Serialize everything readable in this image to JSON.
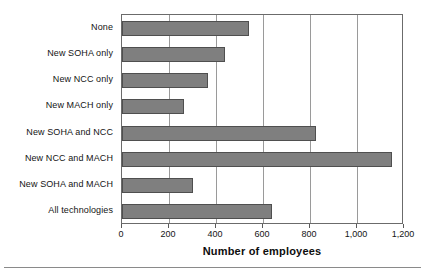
{
  "chart_data": {
    "type": "bar",
    "orientation": "horizontal",
    "title": "",
    "xlabel": "Number of employees",
    "ylabel": "",
    "categories": [
      "None",
      "New SOHA only",
      "New NCC only",
      "New MACH only",
      "New SOHA and NCC",
      "New NCC and MACH",
      "New SOHA and MACH",
      "All technologies"
    ],
    "values": [
      540,
      440,
      365,
      265,
      825,
      1150,
      300,
      640
    ],
    "xlim": [
      0,
      1200
    ],
    "xticks": [
      0,
      200,
      400,
      600,
      800,
      1000,
      1200
    ],
    "xtick_labels": [
      "0",
      "200",
      "400",
      "600",
      "800",
      "1,000",
      "1,200"
    ],
    "grid": true,
    "grid_axis": "x",
    "legend": false,
    "bar_color": "#7f7f7f",
    "bar_edge_color": "#4f4f4f",
    "axis_color": "#6b6b6b",
    "gridline_color": "#9a9a9a",
    "background": "#ffffff"
  }
}
